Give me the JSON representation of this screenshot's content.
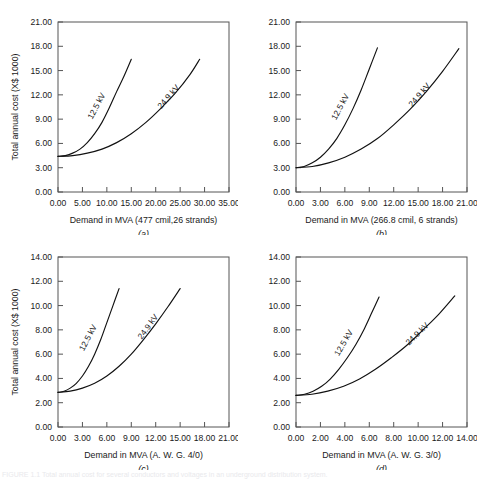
{
  "figure": {
    "ylabel": "Total annual cost (X$ 1000)",
    "bottom_caption": "FIGURE 1.1   Total annual cost for several conductors and voltages in an underground distribution system."
  },
  "chart_data": [
    {
      "id": "a",
      "type": "line",
      "letter": "(a)",
      "title": "",
      "xlabel": "Demand in MVA (477 cmil,26 strands)",
      "ylabel": "Total annual cost (X$ 1000)",
      "xlim": [
        0.0,
        35.0
      ],
      "ylim": [
        0.0,
        21.0
      ],
      "xticks": [
        "0.00",
        "5.00",
        "10.00",
        "15.00",
        "20.00",
        "25.00",
        "30.00",
        "35.00"
      ],
      "yticks": [
        "0.00",
        "3.00",
        "6.00",
        "9.00",
        "12.00",
        "15.00",
        "18.00",
        "21.00"
      ],
      "xtick_values": [
        0,
        5,
        10,
        15,
        20,
        25,
        30,
        35
      ],
      "ytick_values": [
        0,
        3,
        6,
        9,
        12,
        15,
        18,
        21
      ],
      "grid": false,
      "legend": "inline-labels",
      "series": [
        {
          "name": "12.5 kV",
          "label": "12.5 kV",
          "x": [
            0.0,
            1.5,
            3.0,
            4.5,
            6.0,
            7.5,
            9.0,
            10.5,
            12.0,
            13.5,
            15.0
          ],
          "y": [
            4.4,
            4.5,
            4.8,
            5.3,
            6.1,
            7.2,
            8.6,
            10.4,
            12.4,
            14.3,
            16.4
          ]
        },
        {
          "name": "24.9 kV",
          "label": "24.9 kV",
          "x": [
            0.0,
            3.0,
            6.0,
            9.0,
            12.0,
            15.0,
            18.0,
            21.0,
            24.0,
            27.0,
            29.0
          ],
          "y": [
            4.4,
            4.5,
            4.8,
            5.3,
            6.1,
            7.2,
            8.6,
            10.3,
            12.2,
            14.5,
            16.4
          ]
        }
      ]
    },
    {
      "id": "b",
      "type": "line",
      "letter": "(b)",
      "title": "",
      "xlabel": "Demand in MVA (266.8 cmil, 6 strands)",
      "ylabel": "Total annual cost (X$ 1000)",
      "xlim": [
        0.0,
        21.0
      ],
      "ylim": [
        0.0,
        21.0
      ],
      "xticks": [
        "0.00",
        "3.00",
        "6.00",
        "9.00",
        "12.00",
        "15.00",
        "18.00",
        "21.00"
      ],
      "yticks": [
        "0.00",
        "3.00",
        "6.00",
        "9.00",
        "12.00",
        "15.00",
        "18.00",
        "21.00"
      ],
      "xtick_values": [
        0,
        3,
        6,
        9,
        12,
        15,
        18,
        21
      ],
      "ytick_values": [
        0,
        3,
        6,
        9,
        12,
        15,
        18,
        21
      ],
      "grid": false,
      "legend": "inline-labels",
      "series": [
        {
          "name": "12.5 kV",
          "label": "12.5 kV",
          "x": [
            0.0,
            1.0,
            2.0,
            3.0,
            4.0,
            5.0,
            6.0,
            7.0,
            8.0,
            9.0,
            10.0
          ],
          "y": [
            3.0,
            3.15,
            3.6,
            4.3,
            5.3,
            6.6,
            8.3,
            10.3,
            12.6,
            15.2,
            17.8
          ]
        },
        {
          "name": "24.9 kV",
          "label": "24.9 kV",
          "x": [
            0.0,
            2.0,
            4.0,
            6.0,
            8.0,
            10.0,
            12.0,
            14.0,
            16.0,
            18.0,
            20.0
          ],
          "y": [
            3.0,
            3.15,
            3.6,
            4.3,
            5.3,
            6.6,
            8.3,
            10.2,
            12.4,
            14.9,
            17.7
          ]
        }
      ]
    },
    {
      "id": "c",
      "type": "line",
      "letter": "(c)",
      "title": "",
      "xlabel": "Demand in MVA (A. W. G. 4/0)",
      "ylabel": "Total annual cost (X$ 1000)",
      "xlim": [
        0.0,
        21.0
      ],
      "ylim": [
        0.0,
        14.0
      ],
      "xticks": [
        "0.00",
        "3.00",
        "6.00",
        "9.00",
        "12.00",
        "15.00",
        "18.00",
        "21.00"
      ],
      "yticks": [
        "0.00",
        "2.00",
        "4.00",
        "6.00",
        "8.00",
        "10.00",
        "12.00",
        "14.00"
      ],
      "xtick_values": [
        0,
        3,
        6,
        9,
        12,
        15,
        18,
        21
      ],
      "ytick_values": [
        0,
        2,
        4,
        6,
        8,
        10,
        12,
        14
      ],
      "grid": false,
      "legend": "inline-labels",
      "series": [
        {
          "name": "12.5 kV",
          "label": "12.5 kV",
          "x": [
            0.0,
            0.75,
            1.5,
            2.25,
            3.0,
            3.75,
            4.5,
            5.25,
            6.0,
            6.75,
            7.5
          ],
          "y": [
            2.85,
            2.95,
            3.2,
            3.6,
            4.2,
            5.0,
            6.0,
            7.2,
            8.6,
            10.0,
            11.4
          ]
        },
        {
          "name": "24.9 kV",
          "label": "24.9 kV",
          "x": [
            0.0,
            1.5,
            3.0,
            4.5,
            6.0,
            7.5,
            9.0,
            10.5,
            12.0,
            13.5,
            15.0
          ],
          "y": [
            2.85,
            2.95,
            3.2,
            3.6,
            4.2,
            5.0,
            6.0,
            7.2,
            8.5,
            9.9,
            11.4
          ]
        }
      ]
    },
    {
      "id": "d",
      "type": "line",
      "letter": "(d)",
      "title": "",
      "xlabel": "Demand in MVA (A. W. G. 3/0)",
      "ylabel": "Total annual cost (X$ 1000)",
      "xlim": [
        0.0,
        14.0
      ],
      "ylim": [
        0.0,
        14.0
      ],
      "xticks": [
        "0.00",
        "2.00",
        "4.00",
        "6.00",
        "8.00",
        "10.00",
        "12.00",
        "14.00"
      ],
      "yticks": [
        "0.00",
        "2.00",
        "4.00",
        "6.00",
        "8.00",
        "10.00",
        "12.00",
        "14.00"
      ],
      "xtick_values": [
        0,
        2,
        4,
        6,
        8,
        10,
        12,
        14
      ],
      "ytick_values": [
        0,
        2,
        4,
        6,
        8,
        10,
        12,
        14
      ],
      "grid": false,
      "legend": "inline-labels",
      "series": [
        {
          "name": "12.5 kV",
          "label": "12.5 kV",
          "x": [
            0.0,
            0.7,
            1.4,
            2.1,
            2.8,
            3.5,
            4.2,
            4.9,
            5.6,
            6.2,
            6.8
          ],
          "y": [
            2.6,
            2.7,
            2.95,
            3.35,
            3.95,
            4.75,
            5.7,
            6.8,
            8.1,
            9.4,
            10.7
          ]
        },
        {
          "name": "24.9 kV",
          "label": "24.9 kV",
          "x": [
            0.0,
            1.3,
            2.6,
            3.9,
            5.2,
            6.5,
            7.8,
            9.1,
            10.4,
            11.7,
            13.0
          ],
          "y": [
            2.6,
            2.7,
            2.95,
            3.35,
            3.95,
            4.75,
            5.7,
            6.75,
            8.0,
            9.3,
            10.8
          ]
        }
      ]
    }
  ]
}
